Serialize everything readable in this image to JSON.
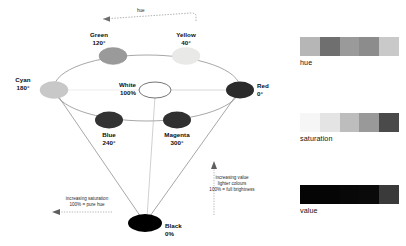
{
  "figure": {
    "type": "hsv-colour-cone-diagram",
    "background": "#ffffff"
  },
  "hue_axis": {
    "label": "hue",
    "arrow_direction": "left"
  },
  "nodes": [
    {
      "id": "green",
      "name": "Green",
      "value": "120°",
      "fill": "#9a9a9a",
      "cx": 113,
      "cy": 56,
      "rx": 14,
      "ry": 8.5,
      "label_x": 78,
      "label_y": 33,
      "align": "center"
    },
    {
      "id": "yellow",
      "name": "Yellow",
      "value": "40°",
      "fill": "#e9e9e7",
      "cx": 186,
      "cy": 56,
      "rx": 14,
      "ry": 8.5,
      "label_x": 152,
      "label_y": 33,
      "align": "center"
    },
    {
      "id": "cyan",
      "name": "Cyan",
      "value": "180°",
      "fill": "#c8c8c8",
      "cx": 54,
      "cy": 90,
      "rx": 14,
      "ry": 8.5,
      "label_x": 8,
      "label_y": 78,
      "align": "center"
    },
    {
      "id": "red",
      "name": "Red",
      "value": "0°",
      "fill": "#2b2b2b",
      "cx": 240,
      "cy": 90,
      "rx": 14,
      "ry": 8.5,
      "label_x": 257,
      "label_y": 79,
      "align": "left"
    },
    {
      "id": "blue",
      "name": "Blue",
      "value": "240°",
      "fill": "#333333",
      "cx": 109,
      "cy": 120,
      "rx": 14,
      "ry": 8.5,
      "label_x": 93,
      "label_y": 131,
      "align": "center"
    },
    {
      "id": "magenta",
      "name": "Magenta",
      "value": "300°",
      "fill": "#303030",
      "cx": 177,
      "cy": 120,
      "rx": 14,
      "ry": 8.5,
      "label_x": 155,
      "label_y": 131,
      "align": "center"
    },
    {
      "id": "white",
      "name": "White",
      "value": "100%",
      "fill": "#ffffff",
      "cx": 155,
      "cy": 90,
      "rx": 16,
      "ry": 8.0,
      "label_x": 110,
      "label_y": 79,
      "align": "center"
    },
    {
      "id": "black",
      "name": "Black",
      "value": "0%",
      "fill": "#000000",
      "cx": 145,
      "cy": 223,
      "rx": 17,
      "ry": 9.0,
      "label_x": 164,
      "label_y": 221,
      "align": "left"
    }
  ],
  "annotations": {
    "saturation": {
      "line1": "increasing saturation",
      "line2": "100% = pure hue",
      "arrow_direction": "left"
    },
    "value": {
      "line1": "increasing value",
      "line2": "lighter colours",
      "line3": "100% = full brightness",
      "arrow_direction": "up"
    }
  },
  "swatches": [
    {
      "id": "hue",
      "caption": "hue",
      "colors": [
        "#b6b6b6",
        "#6f6f6f",
        "#9a9a9a",
        "#8c8c8c",
        "#c9c9c9"
      ]
    },
    {
      "id": "saturation",
      "caption": "saturation",
      "colors": [
        "#f6f6f6",
        "#e4e4e4",
        "#bdbdbd",
        "#999999",
        "#4a4a4a"
      ]
    },
    {
      "id": "value",
      "caption": "value",
      "colors": [
        "#050505",
        "#050505",
        "#080808",
        "#0a0a0a",
        "#3a3a3a"
      ]
    }
  ]
}
